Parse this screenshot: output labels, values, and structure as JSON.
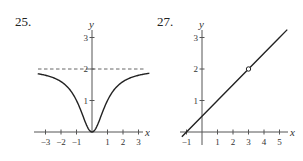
{
  "chart_data": [
    {
      "type": "line",
      "label": "25.",
      "title": "",
      "xlabel": "x",
      "ylabel": "y",
      "xlim": [
        -3.5,
        3.7
      ],
      "ylim": [
        0,
        3.2
      ],
      "x_ticks": [
        -3,
        -2,
        -1,
        0,
        1,
        2,
        3
      ],
      "x_tick_labels": [
        "−3",
        "−2",
        "−1",
        "",
        "1",
        "2",
        "3"
      ],
      "y_ticks": [
        1,
        2,
        3
      ],
      "y_tick_labels": [
        "1",
        "2",
        "3"
      ],
      "grid": false,
      "series": [
        {
          "name": "curve",
          "x": [
            -3.5,
            -3,
            -2.5,
            -2,
            -1.5,
            -1,
            -0.5,
            0,
            0.5,
            1,
            1.5,
            2,
            2.5,
            3,
            3.5
          ],
          "values": [
            1.85,
            1.8,
            1.72,
            1.6,
            1.38,
            1.0,
            0.4,
            0,
            0.4,
            1.0,
            1.38,
            1.6,
            1.72,
            1.8,
            1.85
          ]
        }
      ],
      "asymptotes": [
        {
          "type": "horizontal",
          "y": 2,
          "style": "dashed"
        }
      ]
    },
    {
      "type": "line",
      "label": "27.",
      "title": "",
      "xlabel": "x",
      "ylabel": "y",
      "xlim": [
        -1.3,
        5.6
      ],
      "ylim": [
        -0.2,
        3.2
      ],
      "x_ticks": [
        -1,
        1,
        2,
        3,
        4,
        5
      ],
      "x_tick_labels": [
        "−1",
        "1",
        "2",
        "3",
        "4",
        "5"
      ],
      "y_ticks": [
        1,
        2,
        3
      ],
      "y_tick_labels": [
        "1",
        "2",
        "3"
      ],
      "grid": false,
      "series": [
        {
          "name": "line",
          "x": [
            -1.3,
            -1,
            0,
            1,
            2,
            3,
            4,
            5,
            5.5
          ],
          "values": [
            -0.15,
            0,
            0.5,
            1,
            1.5,
            2,
            2.5,
            3,
            3.25
          ]
        }
      ],
      "open_points": [
        {
          "x": 3,
          "y": 2
        }
      ]
    }
  ]
}
